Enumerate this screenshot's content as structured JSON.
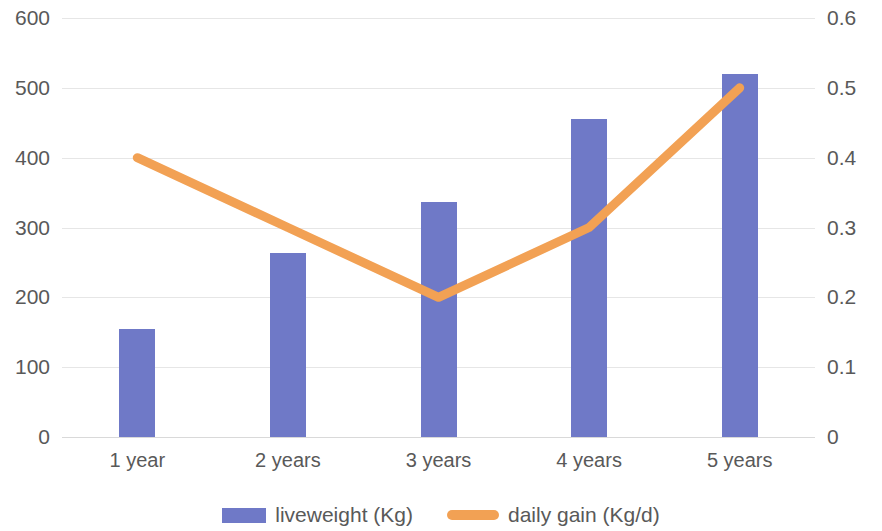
{
  "chart_data": {
    "type": "bar",
    "title": "",
    "subtitle": "",
    "xlabel": "",
    "ylabel": "",
    "categories": [
      "1 year",
      "2 years",
      "3 years",
      "4 years",
      "5 years"
    ],
    "grid": true,
    "legend_position": "bottom",
    "axes": {
      "left": {
        "label": "",
        "ylim": [
          0,
          600
        ],
        "ticks": [
          0,
          100,
          200,
          300,
          400,
          500,
          600
        ],
        "tick_labels": [
          "0",
          "100",
          "200",
          "300",
          "400",
          "500",
          "600"
        ]
      },
      "right": {
        "label": "",
        "ylim": [
          0,
          0.6
        ],
        "ticks": [
          0,
          0.1,
          0.2,
          0.3,
          0.4,
          0.5,
          0.6
        ],
        "tick_labels": [
          "0",
          "0.1",
          "0.2",
          "0.3",
          "0.4",
          "0.5",
          "0.6"
        ]
      }
    },
    "series": [
      {
        "name": "liveweight (Kg)",
        "type": "bar",
        "axis": "left",
        "color": "#6f79c7",
        "values": [
          155,
          264,
          337,
          455,
          520
        ]
      },
      {
        "name": "daily gain (Kg/d)",
        "type": "line",
        "axis": "right",
        "color": "#f2a154",
        "values": [
          0.4,
          0.3,
          0.2,
          0.3,
          0.5
        ]
      }
    ]
  },
  "legend": {
    "items": [
      {
        "label": "liveweight (Kg)",
        "icon": "bar-swatch-icon",
        "color": "#6f79c7"
      },
      {
        "label": "daily gain (Kg/d)",
        "icon": "line-swatch-icon",
        "color": "#f2a154"
      }
    ]
  }
}
